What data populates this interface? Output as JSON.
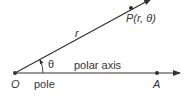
{
  "diagram": {
    "type": "polar-coordinates",
    "points": {
      "pole": {
        "label": "O",
        "x": 15,
        "y": 73
      },
      "axis_point": {
        "label": "A",
        "x": 157,
        "y": 73
      },
      "point": {
        "label": "P(r, θ)",
        "x": 131,
        "y": 8
      }
    },
    "labels": {
      "radius": "r",
      "angle": "θ",
      "axis": "polar axis",
      "pole_name": "pole",
      "origin": "O",
      "axis_end": "A",
      "point": "P(r, θ)"
    },
    "colors": {
      "line": "#333333",
      "text": "#333333",
      "background": "#ffffff"
    }
  }
}
